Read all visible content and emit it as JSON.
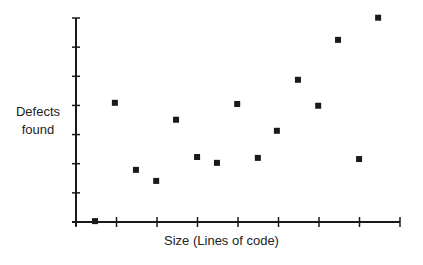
{
  "chart_data": {
    "type": "scatter",
    "title": "",
    "xlabel": "Size (Lines of code)",
    "ylabel": "Defects found",
    "ylabel_lines": [
      "Defects",
      "found"
    ],
    "x_ticks": 8,
    "y_ticks": 7,
    "xlim": [
      0,
      8
    ],
    "ylim": [
      0,
      7
    ],
    "tick_labels_shown": false,
    "grid": false,
    "legend": null,
    "marker": "square",
    "marker_color": "#1a1a1a",
    "axis_color": "#1a1a1a",
    "points": [
      {
        "x": 0.47,
        "y": 0.03
      },
      {
        "x": 0.96,
        "y": 4.09
      },
      {
        "x": 1.48,
        "y": 1.79
      },
      {
        "x": 1.98,
        "y": 1.41
      },
      {
        "x": 2.47,
        "y": 3.51
      },
      {
        "x": 2.99,
        "y": 2.23
      },
      {
        "x": 3.48,
        "y": 2.03
      },
      {
        "x": 3.98,
        "y": 4.05
      },
      {
        "x": 4.49,
        "y": 2.2
      },
      {
        "x": 4.96,
        "y": 3.13
      },
      {
        "x": 5.48,
        "y": 4.88
      },
      {
        "x": 5.98,
        "y": 3.99
      },
      {
        "x": 6.47,
        "y": 6.25
      },
      {
        "x": 6.99,
        "y": 2.16
      },
      {
        "x": 7.46,
        "y": 7.01
      }
    ]
  }
}
